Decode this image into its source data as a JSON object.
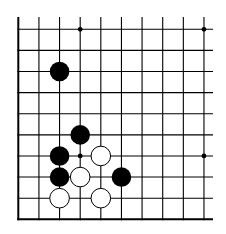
{
  "board": {
    "title": "Go board diagram (lower-left corner section)",
    "columns": 10,
    "rows": 10,
    "origin_x": 18.3,
    "origin_y": 29.3,
    "spacing_x": 20.63,
    "spacing_y": 21.11,
    "line_top_extension_y": 17,
    "line_right_extension_x": 213,
    "edges": {
      "left": true,
      "bottom": true,
      "top": false,
      "right": false
    },
    "colors": {
      "background": "#ffffff",
      "line": "#000000",
      "black_stone": "#000000",
      "white_stone_fill": "#ffffff",
      "white_stone_stroke": "#000000"
    },
    "star_points": [
      {
        "col": 4,
        "row": 1
      },
      {
        "col": 10,
        "row": 1
      },
      {
        "col": 4,
        "row": 7
      },
      {
        "col": 10,
        "row": 7
      }
    ],
    "stones": [
      {
        "color": "black",
        "col": 3,
        "row": 3
      },
      {
        "color": "black",
        "col": 4,
        "row": 6
      },
      {
        "color": "black",
        "col": 3,
        "row": 7
      },
      {
        "color": "white",
        "col": 5,
        "row": 7
      },
      {
        "color": "black",
        "col": 3,
        "row": 8
      },
      {
        "color": "white",
        "col": 4,
        "row": 8
      },
      {
        "color": "black",
        "col": 6,
        "row": 8
      },
      {
        "color": "white",
        "col": 3,
        "row": 9
      },
      {
        "color": "white",
        "col": 5,
        "row": 9
      }
    ],
    "stone_radius": 9.8,
    "star_radius": 2.4
  }
}
